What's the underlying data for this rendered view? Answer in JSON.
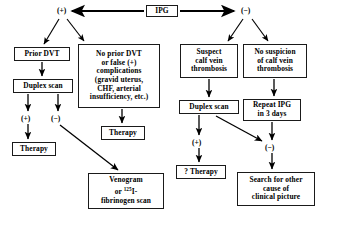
{
  "diagram": {
    "type": "flowchart",
    "ink_color": "#000000",
    "box_border_color": "#1a1a1a",
    "background_color": "#ffffff",
    "nodes": [
      {
        "id": "ipg",
        "label": "IPG",
        "x": 146,
        "y": 5,
        "w": 32,
        "h": 12
      },
      {
        "id": "prior_dvt",
        "label": "Prior  DVT",
        "x": 14,
        "y": 47,
        "w": 56,
        "h": 14
      },
      {
        "id": "complications",
        "label": "No  prior  DVT\nor  false  (+)\ncomplications\n(gravid  uterus,\nCHF,  arterial\ninsufficiency,  etc.)",
        "x": 78,
        "y": 44,
        "w": 82,
        "h": 64
      },
      {
        "id": "suspect_calf",
        "label": "Suspect\ncalf  vein\nthrombosis",
        "x": 180,
        "y": 44,
        "w": 58,
        "h": 34
      },
      {
        "id": "no_suspicion",
        "label": "No  suspicion\nof  calf  vein\nthrombosis",
        "x": 243,
        "y": 44,
        "w": 64,
        "h": 34
      },
      {
        "id": "duplex_left",
        "label": "Duplex  scan",
        "x": 13,
        "y": 79,
        "w": 60,
        "h": 14
      },
      {
        "id": "duplex_right",
        "label": "Duplex  scan",
        "x": 179,
        "y": 100,
        "w": 60,
        "h": 14
      },
      {
        "id": "repeat_ipg",
        "label": "Repeat  IPG\nin  3  days",
        "x": 243,
        "y": 99,
        "w": 58,
        "h": 22
      },
      {
        "id": "therapy_mid",
        "label": "Therapy",
        "x": 101,
        "y": 126,
        "w": 44,
        "h": 14
      },
      {
        "id": "therapy_left",
        "label": "Therapy",
        "x": 12,
        "y": 142,
        "w": 44,
        "h": 14
      },
      {
        "id": "venogram",
        "label_html": "Venogram\nor  <sup>125</sup>I-\nfibrinogen  scan",
        "x": 88,
        "y": 173,
        "w": 76,
        "h": 36
      },
      {
        "id": "q_therapy",
        "label": "?  Therapy",
        "x": 176,
        "y": 165,
        "w": 50,
        "h": 14
      },
      {
        "id": "search_other",
        "label": "Search  for  other\ncause  of\nclinical  picture",
        "x": 237,
        "y": 172,
        "w": 78,
        "h": 34
      }
    ],
    "signs": [
      {
        "id": "sign_plus_top",
        "label": "(+)",
        "x": 57,
        "y": 6
      },
      {
        "id": "sign_minus_top",
        "label": "(−)",
        "x": 241,
        "y": 6
      },
      {
        "id": "sign_plus_left",
        "label": "(+)",
        "x": 21,
        "y": 114
      },
      {
        "id": "sign_minus_left",
        "label": "(−)",
        "x": 51,
        "y": 114
      },
      {
        "id": "sign_plus_right",
        "label": "(+)",
        "x": 192,
        "y": 138
      },
      {
        "id": "sign_minus_right",
        "label": "(−)",
        "x": 265,
        "y": 143
      }
    ],
    "edges": [
      {
        "id": "edge-ipg-to-plus",
        "from": "ipg",
        "to": "sign_plus_top",
        "style": "thick-arrow"
      },
      {
        "id": "edge-ipg-to-minus",
        "from": "ipg",
        "to": "sign_minus_top",
        "style": "thick-arrow"
      },
      {
        "id": "edge-plus-to-prior-dvt",
        "from": "sign_plus_top",
        "to": "prior_dvt",
        "style": "arrow"
      },
      {
        "id": "edge-plus-to-complications",
        "from": "sign_plus_top",
        "to": "complications",
        "style": "arrow"
      },
      {
        "id": "edge-minus-to-suspect",
        "from": "sign_minus_top",
        "to": "suspect_calf",
        "style": "arrow"
      },
      {
        "id": "edge-minus-to-no-suspicion",
        "from": "sign_minus_top",
        "to": "no_suspicion",
        "style": "arrow"
      },
      {
        "id": "edge-prior-dvt-to-duplex",
        "from": "prior_dvt",
        "to": "duplex_left",
        "style": "arrow"
      },
      {
        "id": "edge-duplex-to-plus",
        "from": "duplex_left",
        "to": "sign_plus_left",
        "style": "arrow"
      },
      {
        "id": "edge-duplex-to-minus",
        "from": "duplex_left",
        "to": "sign_minus_left",
        "style": "arrow"
      },
      {
        "id": "edge-plus-to-therapy",
        "from": "sign_plus_left",
        "to": "therapy_left",
        "style": "arrow"
      },
      {
        "id": "edge-minus-to-venogram",
        "from": "sign_minus_left",
        "to": "venogram",
        "style": "arrow"
      },
      {
        "id": "edge-complications-to-therapy",
        "from": "complications",
        "to": "therapy_mid",
        "style": "arrow"
      },
      {
        "id": "edge-suspect-to-duplex",
        "from": "suspect_calf",
        "to": "duplex_right",
        "style": "arrow"
      },
      {
        "id": "edge-no-suspicion-to-repeat",
        "from": "no_suspicion",
        "to": "repeat_ipg",
        "style": "arrow"
      },
      {
        "id": "edge-duplex-right-to-plus",
        "from": "duplex_right",
        "to": "sign_plus_right",
        "style": "arrow"
      },
      {
        "id": "edge-duplex-right-to-minus",
        "from": "duplex_right",
        "to": "sign_minus_right",
        "style": "arrow"
      },
      {
        "id": "edge-repeat-to-minus",
        "from": "repeat_ipg",
        "to": "sign_minus_right",
        "style": "arrow"
      },
      {
        "id": "edge-plus-to-q-therapy",
        "from": "sign_plus_right",
        "to": "q_therapy",
        "style": "arrow"
      },
      {
        "id": "edge-minus-to-search",
        "from": "sign_minus_right",
        "to": "search_other",
        "style": "arrow"
      }
    ]
  }
}
